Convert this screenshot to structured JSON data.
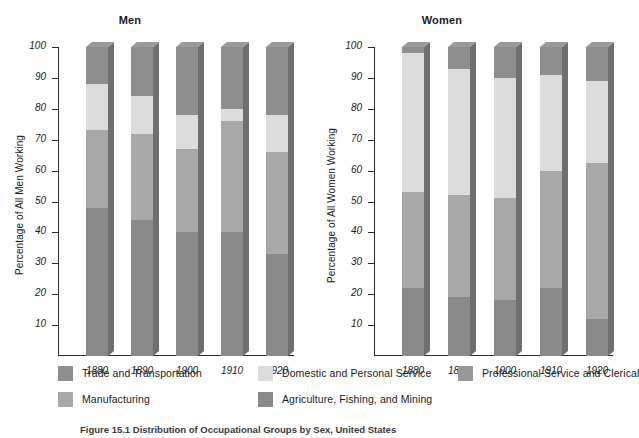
{
  "chart_data": {
    "type": "bar",
    "subtype": "stacked-percentage-3d",
    "title": "",
    "caption": "Figure 15.1  Distribution of Occupational Groups by Sex, United States",
    "categories": [
      "1880",
      "1890",
      "1900",
      "1910",
      "1920"
    ],
    "ylabel_men": "Percentage of All Men Working",
    "ylabel_women": "Percentage of All Women Working",
    "ylim": [
      0,
      100
    ],
    "yticks": [
      10,
      20,
      30,
      40,
      50,
      60,
      70,
      80,
      90,
      100
    ],
    "ytick_labels": [
      "10",
      "20",
      "30",
      "40",
      "50",
      "60",
      "70",
      "80",
      "90",
      "100"
    ],
    "grid": false,
    "legend_position": "bottom",
    "legend": [
      {
        "label": "Trade and Transportation",
        "color": "#8e8e8e"
      },
      {
        "label": "Domestic and Personal Service",
        "color": "#dcdcdc"
      },
      {
        "label": "Professional Service and Clerical",
        "color": "#999999"
      },
      {
        "label": "Manufacturing",
        "color": "#a8a8a8"
      },
      {
        "label": "Agriculture, Fishing, and Mining",
        "color": "#8a8a8a"
      }
    ],
    "panels": [
      {
        "name": "Men",
        "title": "Men",
        "ylabel": "Percentage of All Men Working",
        "series": [
          {
            "name": "Agriculture, Fishing, and Mining",
            "color": "#8a8a8a",
            "values": [
              48,
              44,
              40,
              40,
              33
            ]
          },
          {
            "name": "Manufacturing",
            "color": "#a8a8a8",
            "values": [
              25,
              28,
              27,
              36,
              33
            ]
          },
          {
            "name": "Domestic and Personal Service",
            "color": "#dcdcdc",
            "values": [
              15,
              12,
              11,
              4,
              12
            ]
          },
          {
            "name": "Trade and Transportation",
            "color": "#8e8e8e",
            "values": [
              12,
              16,
              22,
              20,
              22
            ]
          }
        ],
        "cumulative_tops": [
          [
            48,
            73,
            88,
            100
          ],
          [
            44,
            72,
            84,
            100
          ],
          [
            40,
            67,
            78,
            100
          ],
          [
            40,
            76,
            80,
            100
          ],
          [
            33,
            66,
            78,
            100
          ]
        ]
      },
      {
        "name": "Women",
        "title": "Women",
        "ylabel": "Percentage of All Women Working",
        "series": [
          {
            "name": "Agriculture, Fishing, and Mining",
            "color": "#8a8a8a",
            "values": [
              22,
              19,
              18,
              22,
              12
            ]
          },
          {
            "name": "Manufacturing",
            "color": "#a8a8a8",
            "values": [
              31,
              33,
              33,
              38,
              50.5
            ]
          },
          {
            "name": "Domestic and Personal Service",
            "color": "#dcdcdc",
            "values": [
              45,
              41,
              39,
              31,
              26.5
            ]
          },
          {
            "name": "Trade and Transportation",
            "color": "#8e8e8e",
            "values": [
              2,
              7,
              10,
              9,
              11
            ]
          }
        ],
        "cumulative_tops": [
          [
            22,
            53,
            98,
            100
          ],
          [
            19,
            52,
            93,
            100
          ],
          [
            18,
            51,
            90,
            100
          ],
          [
            22,
            60,
            91,
            100
          ],
          [
            12,
            62.5,
            89,
            100
          ]
        ]
      }
    ]
  }
}
